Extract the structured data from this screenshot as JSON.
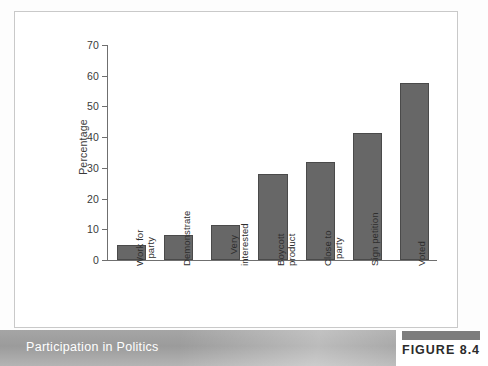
{
  "figure": {
    "caption": "Participation in Politics",
    "badge_label": "FIGURE 8.4",
    "badge_color": "#7d7d7d",
    "footer_band_color": "#9b9b9b"
  },
  "chart_data": {
    "type": "bar",
    "title": "",
    "subtitle": "",
    "xlabel": "",
    "ylabel": "Percentage",
    "ylim": [
      0,
      70
    ],
    "yticks": [
      0,
      10,
      20,
      30,
      40,
      50,
      60,
      70
    ],
    "ytick_labels": [
      "0",
      "10",
      "20",
      "30",
      "40",
      "50",
      "60",
      "70"
    ],
    "grid": false,
    "legend": false,
    "legend_position": "none",
    "bar_color": "#676767",
    "bar_edge_color": "#4a4a4a",
    "axis_color": "#6f6f6f",
    "label_rotation": -90,
    "categories": [
      "Work for\nparty",
      "Demonstrate",
      "Very\ninterested",
      "Boycott\nproduct",
      "Close to\nparty",
      "Sign petition",
      "Voted"
    ],
    "values": [
      5,
      8,
      11.5,
      28,
      32,
      41.5,
      57.5
    ],
    "series": [
      {
        "name": "Percentage",
        "values": [
          5,
          8,
          11.5,
          28,
          32,
          41.5,
          57.5
        ]
      }
    ]
  }
}
